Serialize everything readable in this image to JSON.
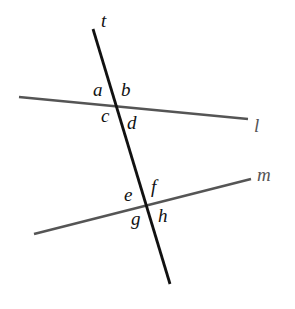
{
  "diagram": {
    "lines": {
      "transversal": {
        "label": "t",
        "color": "#111111"
      },
      "line_l": {
        "label": "l",
        "color": "#555555"
      },
      "line_m": {
        "label": "m",
        "color": "#555555"
      }
    },
    "angles": {
      "a": "a",
      "b": "b",
      "c": "c",
      "d": "d",
      "e": "e",
      "f": "f",
      "g": "g",
      "h": "h"
    }
  }
}
